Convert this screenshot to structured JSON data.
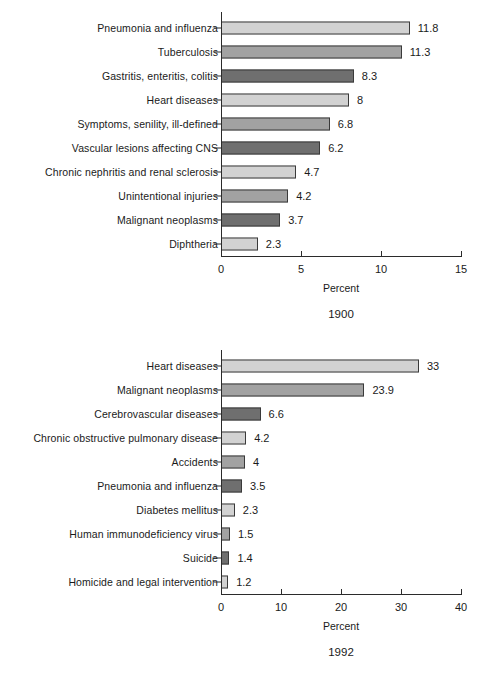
{
  "chart_data": [
    {
      "type": "bar",
      "orientation": "horizontal",
      "title": "1900",
      "xlabel": "Percent",
      "ylabel": "",
      "xlim": [
        0,
        15
      ],
      "xticks": [
        0,
        5,
        10,
        15
      ],
      "xticklabels": [
        "0",
        "5",
        "10",
        "15"
      ],
      "grid": false,
      "legend": "none",
      "categories": [
        "Pneumonia and influenza",
        "Tuberculosis",
        "Gastritis, enteritis, colitis",
        "Heart diseases",
        "Symptoms, senility, ill-defined",
        "Vascular lesions affecting CNS",
        "Chronic nephritis and renal sclerosis",
        "Unintentional injuries",
        "Malignant neoplasms",
        "Diphtheria"
      ],
      "values": [
        11.8,
        11.3,
        8.3,
        8,
        6.8,
        6.2,
        4.7,
        4.2,
        3.7,
        2.3
      ],
      "value_labels": [
        "11.8",
        "11.3",
        "8.3",
        "8",
        "6.8",
        "6.2",
        "4.7",
        "4.2",
        "3.7",
        "2.3"
      ],
      "shades": [
        "light",
        "mid",
        "dark",
        "light",
        "mid",
        "dark",
        "light",
        "mid",
        "dark",
        "light"
      ]
    },
    {
      "type": "bar",
      "orientation": "horizontal",
      "title": "1992",
      "xlabel": "Percent",
      "ylabel": "",
      "xlim": [
        0,
        40
      ],
      "xticks": [
        0,
        10,
        20,
        30,
        40
      ],
      "xticklabels": [
        "0",
        "10",
        "20",
        "30",
        "40"
      ],
      "grid": false,
      "legend": "none",
      "categories": [
        "Heart diseases",
        "Malignant neoplasms",
        "Cerebrovascular diseases",
        "Chronic obstructive pulmonary disease",
        "Accidents",
        "Pneumonia and influenza",
        "Diabetes mellitus",
        "Human immunodeficiency virus",
        "Suicide",
        "Homicide and legal intervention"
      ],
      "values": [
        33,
        23.9,
        6.6,
        4.2,
        4,
        3.5,
        2.3,
        1.5,
        1.4,
        1.2
      ],
      "value_labels": [
        "33",
        "23.9",
        "6.6",
        "4.2",
        "4",
        "3.5",
        "2.3",
        "1.5",
        "1.4",
        "1.2"
      ],
      "shades": [
        "light",
        "mid",
        "dark",
        "light",
        "mid",
        "dark",
        "light",
        "mid",
        "dark",
        "light"
      ]
    }
  ],
  "colors": {
    "shade_light": "#d2d2d2",
    "shade_mid": "#a2a2a2",
    "shade_dark": "#6f6f6f",
    "axis": "#2b2b2b",
    "text": "#1a1a1a",
    "background": "#ffffff"
  }
}
